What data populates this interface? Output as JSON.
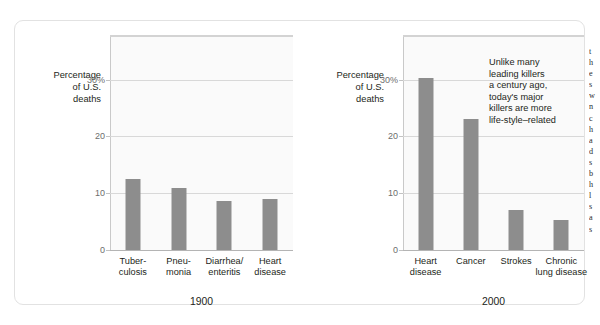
{
  "figure": {
    "axis_title_lines": [
      "Percentage",
      "of U.S.",
      "deaths"
    ],
    "y_ticks": [
      "30%",
      "20",
      "10",
      "0"
    ],
    "annotation_lines": [
      "Unlike many",
      "leading killers",
      "a century ago,",
      "today's major",
      "killers are more",
      "life-style–related"
    ],
    "bar_color": "#8d8d8d",
    "plot_background": "#fafafa",
    "gridline_color": "#d8d8d8",
    "card_border_color": "#e2e2e2"
  },
  "cut_text_column": {
    "lines": [
      "t",
      "h",
      "e",
      "s",
      "w",
      "n",
      "c",
      "h",
      "a",
      "d",
      "s",
      "b",
      "h",
      "l",
      "s",
      "a",
      "s"
    ]
  },
  "chart_data": [
    {
      "type": "bar",
      "title": "1900",
      "xlabel": "1900",
      "ylabel": "Percentage of U.S. deaths",
      "categories": [
        "Tuber-culosis",
        "Pneu-monia",
        "Diarrhea/enteritis",
        "Heart disease"
      ],
      "category_lines": [
        [
          "Tuber-",
          "culosis"
        ],
        [
          "Pneu-",
          "monia"
        ],
        [
          "Diarrhea/",
          "enteritis"
        ],
        [
          "Heart",
          "disease"
        ]
      ],
      "values": [
        12.5,
        11.0,
        8.7,
        9.0
      ],
      "ylim": [
        0,
        37.5
      ],
      "yticks": [
        0,
        10,
        20,
        30
      ],
      "ytick_labels": [
        "0",
        "10",
        "20",
        "30%"
      ],
      "grid": true,
      "legend": "none"
    },
    {
      "type": "bar",
      "title": "2000",
      "xlabel": "2000",
      "ylabel": "Percentage of U.S. deaths",
      "categories": [
        "Heart disease",
        "Cancer",
        "Strokes",
        "Chronic lung disease"
      ],
      "category_lines": [
        [
          "Heart",
          "disease"
        ],
        [
          "Cancer",
          ""
        ],
        [
          "Strokes",
          ""
        ],
        [
          "Chronic",
          "lung disease"
        ]
      ],
      "values": [
        30.3,
        23.0,
        7.0,
        5.2
      ],
      "ylim": [
        0,
        37.5
      ],
      "yticks": [
        0,
        10,
        20,
        30
      ],
      "ytick_labels": [
        "0",
        "10",
        "20",
        "30%"
      ],
      "grid": true,
      "legend": "none",
      "annotation": "Unlike many leading killers a century ago, today's major killers are more life-style–related"
    }
  ]
}
